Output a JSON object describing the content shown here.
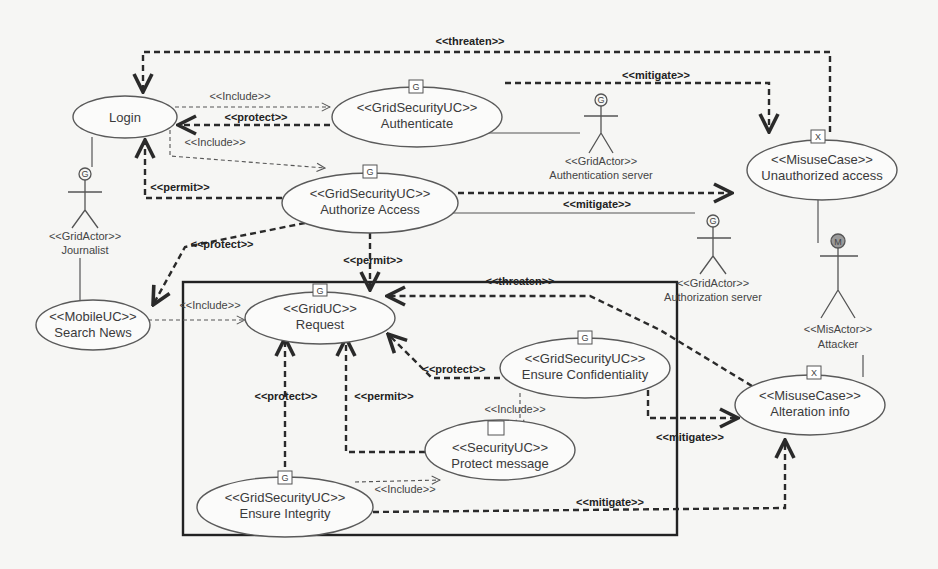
{
  "diagram": {
    "type": "UML misuse-case / use-case diagram",
    "use_cases": {
      "login": {
        "stereotype": "",
        "name": "Login"
      },
      "authenticate": {
        "stereotype": "<<GridSecurityUC>>",
        "name": "Authenticate",
        "icon": "G"
      },
      "authorize": {
        "stereotype": "<<GridSecurityUC>>",
        "name": "Authorize Access",
        "icon": "G"
      },
      "unauthorized": {
        "stereotype": "<<MisuseCase>>",
        "name": "Unauthorized access",
        "icon": "X"
      },
      "search": {
        "stereotype": "<<MobileUC>>",
        "name": "Search News"
      },
      "request": {
        "stereotype": "<<GridUC>>",
        "name": "Request",
        "icon": "G"
      },
      "confidentiality": {
        "stereotype": "<<GridSecurityUC>>",
        "name": "Ensure Confidentiality",
        "icon": "G"
      },
      "alteration": {
        "stereotype": "<<MisuseCase>>",
        "name": "Alteration info",
        "icon": "X"
      },
      "protect_msg": {
        "stereotype": "<<SecurityUC>>",
        "name": "Protect message"
      },
      "integrity": {
        "stereotype": "<<GridSecurityUC>>",
        "name": "Ensure Integrity",
        "icon": "G"
      }
    },
    "actors": {
      "journalist": {
        "stereotype": "<<GridActor>>",
        "name": "Journalist",
        "badge": "G"
      },
      "auth_server": {
        "stereotype": "<<GridActor>>",
        "name": "Authentication server",
        "badge": "G"
      },
      "authz_server": {
        "stereotype": "<<GridActor>>",
        "name": "Authorization server",
        "badge": "G"
      },
      "attacker": {
        "stereotype": "<<MisActor>>",
        "name": "Attacker",
        "badge": "M"
      }
    },
    "relations": {
      "threaten_top": "<<threaten>>",
      "mitigate_top": "<<mitigate>>",
      "include_login_auth": "<<Include>>",
      "protect_auth_login": "<<protect>>",
      "include_login_authz": "<<Include>>",
      "permit_authz_login": "<<permit>>",
      "mitigate_authz": "<<mitigate>>",
      "protect_authz_search": "<<protect>>",
      "permit_authz_request": "<<permit>>",
      "include_search_request": "<<Include>>",
      "threaten_alteration": "<<threaten>>",
      "protect_conf_request": "<<protect>>",
      "protect_integrity_request": "<<protect>>",
      "permit_protectmsg_request": "<<permit>>",
      "include_conf_protectmsg": "<<Include>>",
      "mitigate_conf_alteration": "<<mitigate>>",
      "include_integrity_protectmsg": "<<Include>>",
      "mitigate_integrity_alteration": "<<mitigate>>"
    }
  }
}
